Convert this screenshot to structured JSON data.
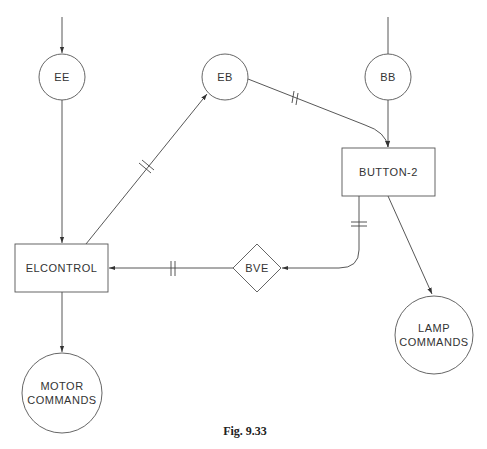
{
  "diagram": {
    "caption": "Fig. 9.33",
    "nodes": {
      "ee": {
        "label": "EE",
        "shape": "circle"
      },
      "eb": {
        "label": "EB",
        "shape": "circle"
      },
      "bb": {
        "label": "BB",
        "shape": "circle"
      },
      "button2": {
        "label": "BUTTON-2",
        "shape": "rectangle"
      },
      "elcontrol": {
        "label": "ELCONTROL",
        "shape": "rectangle"
      },
      "bve": {
        "label": "BVE",
        "shape": "diamond"
      },
      "motor": {
        "label_line1": "MOTOR",
        "label_line2": "COMMANDS",
        "shape": "circle"
      },
      "lamp": {
        "label_line1": "LAMP",
        "label_line2": "COMMANDS",
        "shape": "circle"
      }
    },
    "edges": [
      {
        "from": "external",
        "to": "EE",
        "marker": "arrow"
      },
      {
        "from": "EE",
        "to": "ELCONTROL",
        "marker": "arrow"
      },
      {
        "from": "ELCONTROL",
        "to": "EB",
        "marker": "arrow",
        "tick": "double"
      },
      {
        "from": "EB",
        "to": "BUTTON-2",
        "marker": "arrow",
        "tick": "double"
      },
      {
        "from": "external",
        "to": "BB",
        "marker": "none"
      },
      {
        "from": "BB",
        "to": "BUTTON-2",
        "marker": "arrow"
      },
      {
        "from": "BUTTON-2",
        "to": "BVE",
        "marker": "arrow",
        "tick": "double"
      },
      {
        "from": "BVE",
        "to": "ELCONTROL",
        "marker": "arrow",
        "tick": "double"
      },
      {
        "from": "BUTTON-2",
        "to": "LAMP COMMANDS",
        "marker": "arrow"
      },
      {
        "from": "ELCONTROL",
        "to": "MOTOR COMMANDS",
        "marker": "arrow"
      }
    ]
  }
}
